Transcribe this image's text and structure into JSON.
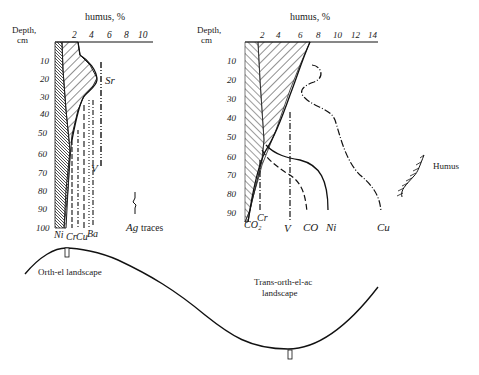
{
  "left_profile": {
    "axis_title": "humus, %",
    "depth_label_1": "Depth,",
    "depth_label_2": "cm",
    "x_ticks": [
      "2",
      "4",
      "6",
      "8",
      "10"
    ],
    "depth_ticks": [
      "10",
      "20",
      "30",
      "40",
      "50",
      "60",
      "70",
      "80",
      "90",
      "100"
    ],
    "element_labels": {
      "ni": "Ni",
      "cr": "Cr",
      "cu": "Cu",
      "ba": "Ba",
      "v": "V",
      "sr": "Sr"
    },
    "ag_note": {
      "symbol": "Ag",
      "text": "traces"
    }
  },
  "right_profile": {
    "axis_title": "humus, %",
    "depth_label_1": "Depth,",
    "depth_label_2": "cm",
    "x_ticks": [
      "2",
      "4",
      "6",
      "8",
      "10",
      "12",
      "14"
    ],
    "depth_ticks": [
      "10",
      "20",
      "30",
      "40",
      "50",
      "60",
      "70",
      "80",
      "90"
    ],
    "element_labels": {
      "co2": "CO₂",
      "cr": "Cr",
      "v": "V",
      "co": "CO",
      "ni": "Ni",
      "cu": "Cu"
    }
  },
  "legend": {
    "humus_label": "Humus"
  },
  "landscape": {
    "left_label": "Orth-el landscape",
    "right_label_line1": "Trans-orth-el-ac",
    "right_label_line2": "landscape"
  }
}
